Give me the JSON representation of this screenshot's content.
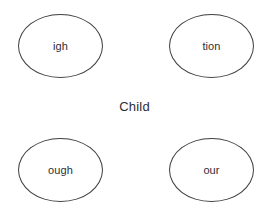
{
  "diagram": {
    "type": "word-web",
    "background_color": "#ffffff",
    "node_stroke_color": "#3f3f44",
    "text_color": "#2e2e33",
    "center": {
      "label": "Child"
    },
    "nodes": [
      {
        "id": "top-left",
        "label": "igh"
      },
      {
        "id": "top-right",
        "label": "tion"
      },
      {
        "id": "bottom-left",
        "label": "ough"
      },
      {
        "id": "bottom-right",
        "label": "our"
      }
    ]
  }
}
